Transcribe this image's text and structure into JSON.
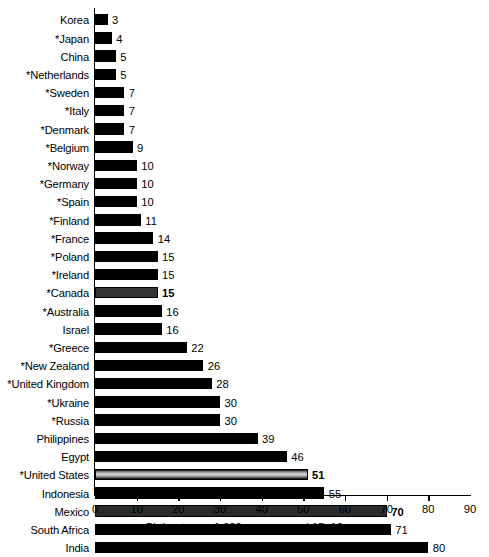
{
  "chart_data": {
    "type": "bar",
    "orientation": "horizontal",
    "title": "",
    "xlabel": "Birth rate per 1,000 women aged 15–19",
    "ylabel": "",
    "xlim": [
      0,
      90
    ],
    "xticks": [
      0,
      10,
      20,
      30,
      40,
      50,
      60,
      70,
      80,
      90
    ],
    "grid": false,
    "legend": null,
    "categories": [
      "Korea",
      "*Japan",
      "China",
      "*Netherlands",
      "*Sweden",
      "*Italy",
      "*Denmark",
      "*Belgium",
      "*Norway",
      "*Germany",
      "*Spain",
      "*Finland",
      "*France",
      "*Poland",
      "*Ireland",
      "*Canada",
      "*Australia",
      "Israel",
      "*Greece",
      "*New Zealand",
      "*United Kingdom",
      "*Ukraine",
      "*Russia",
      "Philippines",
      "Egypt",
      "*United States",
      "Indonesia",
      "Mexico",
      "South Africa",
      "India"
    ],
    "values": [
      3,
      4,
      5,
      5,
      7,
      7,
      7,
      9,
      10,
      10,
      10,
      11,
      14,
      15,
      15,
      15,
      16,
      16,
      22,
      26,
      28,
      30,
      30,
      39,
      46,
      51,
      55,
      70,
      71,
      80
    ],
    "bars": [
      {
        "label": "Korea",
        "value": 3,
        "style": "plain",
        "bold": false
      },
      {
        "label": "*Japan",
        "value": 4,
        "style": "plain",
        "bold": false
      },
      {
        "label": "China",
        "value": 5,
        "style": "plain",
        "bold": false
      },
      {
        "label": "*Netherlands",
        "value": 5,
        "style": "plain",
        "bold": false
      },
      {
        "label": "*Sweden",
        "value": 7,
        "style": "plain",
        "bold": false
      },
      {
        "label": "*Italy",
        "value": 7,
        "style": "plain",
        "bold": false
      },
      {
        "label": "*Denmark",
        "value": 7,
        "style": "plain",
        "bold": false
      },
      {
        "label": "*Belgium",
        "value": 9,
        "style": "plain",
        "bold": false
      },
      {
        "label": "*Norway",
        "value": 10,
        "style": "plain",
        "bold": false
      },
      {
        "label": "*Germany",
        "value": 10,
        "style": "plain",
        "bold": false
      },
      {
        "label": "*Spain",
        "value": 10,
        "style": "plain",
        "bold": false
      },
      {
        "label": "*Finland",
        "value": 11,
        "style": "plain",
        "bold": false
      },
      {
        "label": "*France",
        "value": 14,
        "style": "plain",
        "bold": false
      },
      {
        "label": "*Poland",
        "value": 15,
        "style": "plain",
        "bold": false
      },
      {
        "label": "*Ireland",
        "value": 15,
        "style": "plain",
        "bold": false
      },
      {
        "label": "*Canada",
        "value": 15,
        "style": "highlight-dark",
        "bold": true
      },
      {
        "label": "*Australia",
        "value": 16,
        "style": "plain",
        "bold": false
      },
      {
        "label": "Israel",
        "value": 16,
        "style": "plain",
        "bold": false
      },
      {
        "label": "*Greece",
        "value": 22,
        "style": "plain",
        "bold": false
      },
      {
        "label": "*New Zealand",
        "value": 26,
        "style": "plain",
        "bold": false
      },
      {
        "label": "*United Kingdom",
        "value": 28,
        "style": "plain",
        "bold": false
      },
      {
        "label": "*Ukraine",
        "value": 30,
        "style": "plain",
        "bold": false
      },
      {
        "label": "*Russia",
        "value": 30,
        "style": "plain",
        "bold": false
      },
      {
        "label": "Philippines",
        "value": 39,
        "style": "plain",
        "bold": false
      },
      {
        "label": "Egypt",
        "value": 46,
        "style": "plain",
        "bold": false
      },
      {
        "label": "*United States",
        "value": 51,
        "style": "highlight-light",
        "bold": true
      },
      {
        "label": "Indonesia",
        "value": 55,
        "style": "plain",
        "bold": false
      },
      {
        "label": "Mexico",
        "value": 70,
        "style": "highlight-mid",
        "bold": true
      },
      {
        "label": "South Africa",
        "value": 71,
        "style": "plain",
        "bold": false
      },
      {
        "label": "India",
        "value": 80,
        "style": "plain",
        "bold": false
      }
    ],
    "colors": {
      "bar_default": "#000000",
      "bar_highlight_dark": "#333333",
      "bar_highlight_mid": "#2b2b2b",
      "bar_highlight_light": "#d8d8d8",
      "axis": "#000000",
      "background": "#ffffff"
    }
  }
}
